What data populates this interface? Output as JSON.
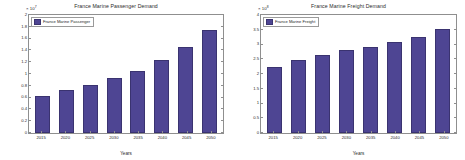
{
  "chart_data": [
    {
      "type": "bar",
      "panel": "left",
      "title": "France Marine Passenger Demand",
      "legend": [
        "France Marine Passenger"
      ],
      "legend_position": "top-left",
      "xlabel": "Years",
      "ylabel": "Million Passenger [p-km]",
      "exponent_label": "× 10",
      "exponent_power": "7",
      "exponent_value": 10000000,
      "categories": [
        "2015",
        "2020",
        "2025",
        "2030",
        "2035",
        "2040",
        "2045",
        "2050"
      ],
      "values": [
        0.62,
        0.73,
        0.82,
        0.93,
        1.05,
        1.23,
        1.45,
        1.75
      ],
      "value_units": "x10^7 p-km",
      "yticks": [
        "0",
        "0.2",
        "0.4",
        "0.6",
        "0.8",
        "1",
        "1.2",
        "1.4",
        "1.6",
        "1.8",
        "2"
      ],
      "ytick_values": [
        0,
        0.2,
        0.4,
        0.6,
        0.8,
        1,
        1.2,
        1.4,
        1.6,
        1.8,
        2
      ],
      "ylim": [
        0,
        2
      ],
      "grid": false,
      "bar_color": "#4e4593"
    },
    {
      "type": "bar",
      "panel": "right",
      "title": "France Marine Freight Demand",
      "legend": [
        "France Marine Freight"
      ],
      "legend_position": "top-left",
      "xlabel": "Years",
      "ylabel": "Million Freight [t-km]",
      "exponent_label": "× 10",
      "exponent_power": "8",
      "exponent_value": 100000000,
      "categories": [
        "2015",
        "2020",
        "2025",
        "2030",
        "2035",
        "2040",
        "2045",
        "2050"
      ],
      "values": [
        2.25,
        2.47,
        2.65,
        2.82,
        2.93,
        3.07,
        3.27,
        3.52
      ],
      "value_units": "x10^8 t-km",
      "yticks": [
        "0",
        "0.5",
        "1",
        "1.5",
        "2",
        "2.5",
        "3",
        "3.5",
        "4"
      ],
      "ytick_values": [
        0,
        0.5,
        1,
        1.5,
        2,
        2.5,
        3,
        3.5,
        4
      ],
      "ylim": [
        0,
        4
      ],
      "grid": false,
      "bar_color": "#4e4593"
    }
  ]
}
